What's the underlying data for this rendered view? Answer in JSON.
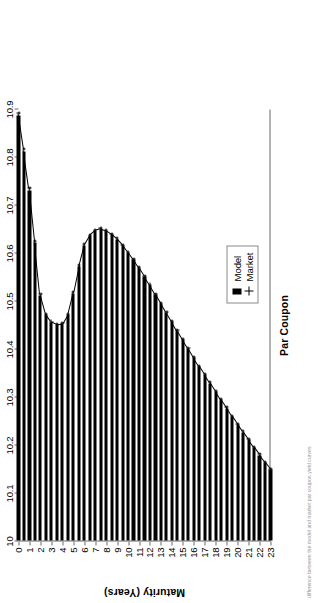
{
  "figure": {
    "orientation_note": "rotated",
    "caption_fragment": "difference between the model and market par coupon yield curves"
  },
  "legend": {
    "position": "top-right",
    "entries": [
      {
        "label": "Model",
        "marker": "filled-square"
      },
      {
        "label": "Market",
        "marker": "plus"
      }
    ]
  },
  "chart_data": {
    "type": "bar",
    "orientation": "horizontal",
    "title": "",
    "xlabel": "Par Coupon",
    "ylabel": "Maturity (Years)",
    "value_axis_label": "Par Coupon",
    "category_axis_label": "Maturity (Years)",
    "xlim": [
      10,
      10.9
    ],
    "ylim": [
      0,
      23
    ],
    "grid": false,
    "value_ticks": [
      "10",
      "10.1",
      "10.2",
      "10.3",
      "10.4",
      "10.5",
      "10.6",
      "10.7",
      "10.8",
      "10.9"
    ],
    "value_tick_values": [
      10,
      10.1,
      10.2,
      10.3,
      10.4,
      10.5,
      10.6,
      10.7,
      10.8,
      10.9
    ],
    "category_ticks": [
      "0",
      "1",
      "2",
      "3",
      "4",
      "5",
      "6",
      "7",
      "8",
      "9",
      "10",
      "11",
      "12",
      "13",
      "14",
      "15",
      "16",
      "17",
      "18",
      "19",
      "20",
      "21",
      "22",
      "23"
    ],
    "categories": [
      0,
      0.5,
      1,
      1.5,
      2,
      2.5,
      3,
      3.5,
      4,
      4.5,
      5,
      5.5,
      6,
      6.5,
      7,
      7.5,
      8,
      8.5,
      9,
      9.5,
      10,
      10.5,
      11,
      11.5,
      12,
      12.5,
      13,
      13.5,
      14,
      14.5,
      15,
      15.5,
      16,
      16.5,
      17,
      17.5,
      18,
      18.5,
      19,
      19.5,
      20,
      20.5,
      21,
      21.5,
      22,
      22.5,
      23
    ],
    "series": [
      {
        "name": "Model",
        "marker": "filled-square",
        "values": [
          10.885,
          10.81,
          10.73,
          10.62,
          10.51,
          10.47,
          10.455,
          10.45,
          10.452,
          10.47,
          10.515,
          10.57,
          10.615,
          10.635,
          10.645,
          10.648,
          10.645,
          10.638,
          10.628,
          10.615,
          10.6,
          10.585,
          10.568,
          10.55,
          10.532,
          10.513,
          10.494,
          10.475,
          10.456,
          10.437,
          10.418,
          10.4,
          10.381,
          10.363,
          10.345,
          10.328,
          10.31,
          10.293,
          10.276,
          10.259,
          10.242,
          10.226,
          10.21,
          10.194,
          10.178,
          10.163,
          10.148
        ]
      },
      {
        "name": "Market",
        "marker": "plus",
        "values": [
          10.89,
          10.815,
          10.735,
          10.624,
          10.513,
          10.472,
          10.456,
          10.451,
          10.453,
          10.472,
          10.518,
          10.573,
          10.618,
          10.637,
          10.647,
          10.65,
          10.646,
          10.639,
          10.629,
          10.616,
          10.601,
          10.586,
          10.569,
          10.551,
          10.533,
          10.514,
          10.495,
          10.476,
          10.457,
          10.438,
          10.419,
          10.401,
          10.382,
          10.364,
          10.346,
          10.329,
          10.311,
          10.294,
          10.277,
          10.26,
          10.243,
          10.227,
          10.211,
          10.195,
          10.179,
          10.164,
          10.149
        ]
      }
    ]
  }
}
